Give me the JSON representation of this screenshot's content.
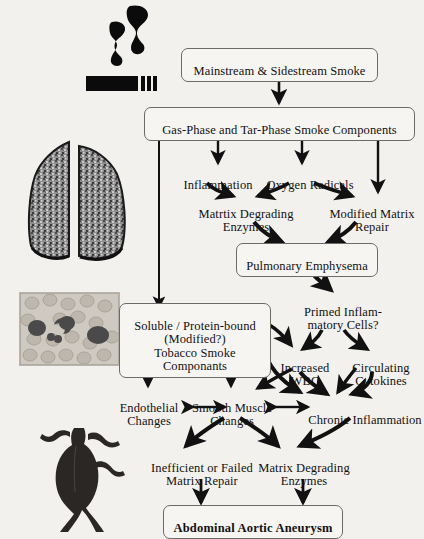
{
  "figure": {
    "background_color": "#f3f1ee",
    "ink_color": "#111111"
  },
  "nodes": {
    "smoke_source": {
      "label": "Mainstream & Sidestream Smoke",
      "boxed": true
    },
    "smoke_components": {
      "label": "Gas-Phase and Tar-Phase Smoke Components",
      "boxed": true
    },
    "inflammation": {
      "label": "Inflammation",
      "boxed": false
    },
    "oxygen_radicals": {
      "label": "Oxygen Radicals",
      "boxed": false
    },
    "matrix_degrading_1": {
      "label": "Matrtix Degrading\nEnzymes",
      "boxed": false
    },
    "modified_matrix": {
      "label": "Modified Matrix\nRepair",
      "boxed": false
    },
    "emphysema": {
      "label": "Pulmonary Emphysema",
      "boxed": true
    },
    "primed_cells": {
      "label": "Primed Inflam-\nmatory Cells?",
      "boxed": false
    },
    "soluble_components": {
      "label": "Soluble / Protein-bound\n(Modified?)\nTobacco Smoke Componants",
      "boxed": true
    },
    "increased_wbc": {
      "label": "Increased\nWBC",
      "boxed": false
    },
    "circulating_cytokines": {
      "label": "Circulating\nCytokines",
      "boxed": false
    },
    "endothelial_changes": {
      "label": "Endothelial\nChanges",
      "boxed": false
    },
    "smooth_muscle": {
      "label": "Smooth Muscle\nChanges",
      "boxed": false
    },
    "chronic_inflammation": {
      "label": "Chronic Inflammation",
      "boxed": false
    },
    "failed_repair": {
      "label": "Inefficient or Failed\nMatrix Repair",
      "boxed": false
    },
    "matrix_degrading_2": {
      "label": "Matrix Degrading\nEnzymes",
      "boxed": false
    },
    "outcome": {
      "label": "Abdominal Aortic Aneurysm",
      "boxed": true,
      "bold": true
    }
  },
  "illustrations": {
    "cigarette": {
      "name": "lit cigarette with rising smoke"
    },
    "lungs": {
      "name": "pair of mottled lungs"
    },
    "blood_smear": {
      "name": "blood smear micrograph with leukocytes"
    },
    "aneurysm": {
      "name": "abdominal aortic aneurysm with iliac branches"
    }
  }
}
